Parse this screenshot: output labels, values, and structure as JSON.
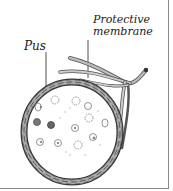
{
  "diagram": {
    "labels": {
      "pus": "Pus",
      "protective_membrane_line1": "Protective",
      "protective_membrane_line2": "membrane"
    },
    "colors": {
      "outline": "#333333",
      "membrane_fill": "#9a9a9a",
      "cell_outline": "#777777",
      "dark_cell": "#555555",
      "border": "#8a8a8a"
    }
  }
}
